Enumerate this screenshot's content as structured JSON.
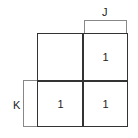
{
  "kmap": {
    "variables": {
      "column": "J",
      "row": "K"
    },
    "cells": [
      {
        "row": 0,
        "col": 0,
        "value": ""
      },
      {
        "row": 0,
        "col": 1,
        "value": "1"
      },
      {
        "row": 1,
        "col": 0,
        "value": "1"
      },
      {
        "row": 1,
        "col": 1,
        "value": "1"
      }
    ]
  }
}
